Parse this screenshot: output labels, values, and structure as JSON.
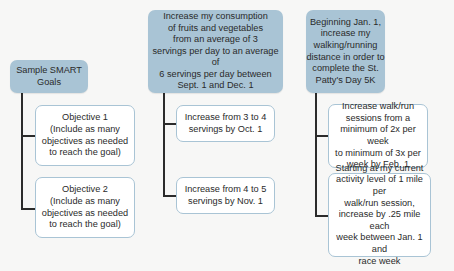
{
  "diagram": {
    "title": "Sample SMART Goals",
    "colors": {
      "header_fill": "#a9c4d5",
      "child_border": "#a9c4d5",
      "connector": "#2b2b2b",
      "background": "#f7f7f6"
    },
    "columns": [
      {
        "header": "Sample SMART\nGoals",
        "children": [
          "Objective 1\n(Include as many\nobjectives as needed\nto reach the goal)",
          "Objective 2\n(Include as many\nobjectives as needed\nto reach the goal)"
        ]
      },
      {
        "header": "Increase my consumption\nof fruits and vegetables\nfrom an average of 3\nservings per day to an average of\n6 servings per day between\nSept. 1 and Dec. 1",
        "children": [
          "Increase from 3 to 4\nservings by Oct. 1",
          "Increase from 4 to 5\nservings by Nov. 1"
        ]
      },
      {
        "header": "Beginning Jan. 1,\nincrease my\nwalking/running\ndistance in order to\ncomplete the St.\nPatty's Day 5K",
        "children": [
          "Increase walk/run\nsessions from a\nminimum of 2x per week\nto minimum of 3x per\nweek by Feb. 1",
          "Starting at my current\nactivity level of 1 mile per\nwalk/run session,\nincrease by .25 mile each\nweek between Jan. 1 and\nrace week"
        ]
      }
    ]
  }
}
